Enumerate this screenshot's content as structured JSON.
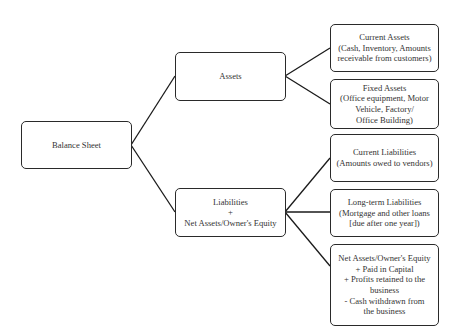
{
  "diagram": {
    "root": {
      "label": "Balance Sheet"
    },
    "branches": [
      {
        "label_lines": [
          "Assets"
        ],
        "children": [
          {
            "lines": [
              "Current Assets",
              "(Cash, Inventory, Amounts",
              "receivable from customers)"
            ]
          },
          {
            "lines": [
              "Fixed Assets",
              "(Office equipment, Motor",
              "Vehicle, Factory/",
              "Office Building)"
            ]
          }
        ]
      },
      {
        "label_lines": [
          "Liabilities",
          "+",
          "Net Assets/Owner's Equity"
        ],
        "children": [
          {
            "lines": [
              "Current Liabilities",
              "(Amounts owed to vendors)"
            ]
          },
          {
            "lines": [
              "Long-term Liabilities",
              "(Mortgage and other loans",
              "[due after one year])"
            ]
          },
          {
            "lines": [
              "Net Assets/Owner's Equity",
              "+ Paid in Capital",
              "+ Profits retained to the",
              "business",
              "- Cash withdrawn from",
              "the business"
            ]
          }
        ]
      }
    ],
    "colors": {
      "line": "#1a1a1a",
      "border": "#2a2a2a",
      "text": "#333333",
      "background": "#ffffff"
    }
  }
}
